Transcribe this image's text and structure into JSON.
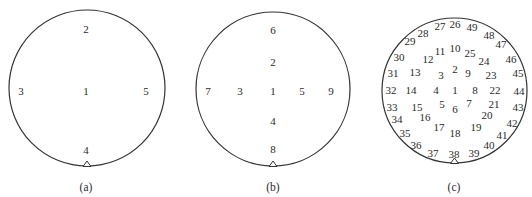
{
  "colors": {
    "stroke": "#333333",
    "text": "#2a2a2a",
    "background": "#ffffff"
  },
  "panels": [
    {
      "id": "a",
      "caption": "(a)",
      "circle": {
        "cx": 87,
        "cy": 88,
        "r": 78
      },
      "caption_pos": {
        "x": 86,
        "y": 187
      },
      "points": [
        {
          "label": "2",
          "x": 86,
          "y": 29
        },
        {
          "label": "3",
          "x": 21,
          "y": 91
        },
        {
          "label": "1",
          "x": 86,
          "y": 91
        },
        {
          "label": "5",
          "x": 146,
          "y": 91
        },
        {
          "label": "4",
          "x": 86,
          "y": 150
        }
      ]
    },
    {
      "id": "b",
      "caption": "(b)",
      "circle": {
        "cx": 273,
        "cy": 89,
        "r": 77
      },
      "caption_pos": {
        "x": 273,
        "y": 187
      },
      "points": [
        {
          "label": "6",
          "x": 273,
          "y": 30
        },
        {
          "label": "2",
          "x": 273,
          "y": 62
        },
        {
          "label": "7",
          "x": 208,
          "y": 91
        },
        {
          "label": "3",
          "x": 240,
          "y": 91
        },
        {
          "label": "1",
          "x": 273,
          "y": 91
        },
        {
          "label": "5",
          "x": 302,
          "y": 91
        },
        {
          "label": "9",
          "x": 331,
          "y": 91
        },
        {
          "label": "4",
          "x": 273,
          "y": 121
        },
        {
          "label": "8",
          "x": 273,
          "y": 149
        }
      ]
    },
    {
      "id": "c",
      "caption": "(c)",
      "circle": {
        "cx": 454.5,
        "cy": 90.5,
        "r": 72.5
      },
      "caption_pos": {
        "x": 454,
        "y": 187
      },
      "points": [
        {
          "label": "27",
          "x": 440,
          "y": 26
        },
        {
          "label": "26",
          "x": 455,
          "y": 24
        },
        {
          "label": "49",
          "x": 472,
          "y": 27
        },
        {
          "label": "28",
          "x": 423,
          "y": 33
        },
        {
          "label": "48",
          "x": 489,
          "y": 35
        },
        {
          "label": "29",
          "x": 410,
          "y": 41
        },
        {
          "label": "47",
          "x": 501,
          "y": 44
        },
        {
          "label": "11",
          "x": 440,
          "y": 51
        },
        {
          "label": "10",
          "x": 455,
          "y": 48
        },
        {
          "label": "25",
          "x": 470,
          "y": 53
        },
        {
          "label": "30",
          "x": 399,
          "y": 57
        },
        {
          "label": "12",
          "x": 428,
          "y": 59
        },
        {
          "label": "24",
          "x": 484,
          "y": 61
        },
        {
          "label": "46",
          "x": 511,
          "y": 59
        },
        {
          "label": "2",
          "x": 455,
          "y": 69
        },
        {
          "label": "31",
          "x": 393,
          "y": 73
        },
        {
          "label": "13",
          "x": 415,
          "y": 72
        },
        {
          "label": "3",
          "x": 441,
          "y": 75
        },
        {
          "label": "9",
          "x": 468,
          "y": 73
        },
        {
          "label": "23",
          "x": 491,
          "y": 75
        },
        {
          "label": "45",
          "x": 518,
          "y": 73
        },
        {
          "label": "32",
          "x": 391,
          "y": 90
        },
        {
          "label": "14",
          "x": 411,
          "y": 90
        },
        {
          "label": "4",
          "x": 436,
          "y": 90
        },
        {
          "label": "1",
          "x": 455,
          "y": 90
        },
        {
          "label": "8",
          "x": 475,
          "y": 90
        },
        {
          "label": "22",
          "x": 495,
          "y": 90
        },
        {
          "label": "44",
          "x": 519,
          "y": 91
        },
        {
          "label": "33",
          "x": 392,
          "y": 107
        },
        {
          "label": "15",
          "x": 417,
          "y": 107
        },
        {
          "label": "5",
          "x": 442,
          "y": 104
        },
        {
          "label": "6",
          "x": 455,
          "y": 109
        },
        {
          "label": "7",
          "x": 469,
          "y": 103
        },
        {
          "label": "21",
          "x": 494,
          "y": 104
        },
        {
          "label": "43",
          "x": 518,
          "y": 107
        },
        {
          "label": "34",
          "x": 397,
          "y": 119
        },
        {
          "label": "16",
          "x": 425,
          "y": 117
        },
        {
          "label": "20",
          "x": 487,
          "y": 115
        },
        {
          "label": "42",
          "x": 512,
          "y": 123
        },
        {
          "label": "17",
          "x": 439,
          "y": 127
        },
        {
          "label": "19",
          "x": 476,
          "y": 127
        },
        {
          "label": "18",
          "x": 455,
          "y": 133
        },
        {
          "label": "35",
          "x": 405,
          "y": 133
        },
        {
          "label": "41",
          "x": 502,
          "y": 135
        },
        {
          "label": "36",
          "x": 416,
          "y": 145
        },
        {
          "label": "40",
          "x": 489,
          "y": 145
        },
        {
          "label": "37",
          "x": 433,
          "y": 153
        },
        {
          "label": "38",
          "x": 454,
          "y": 154
        },
        {
          "label": "39",
          "x": 474,
          "y": 153
        }
      ]
    }
  ]
}
